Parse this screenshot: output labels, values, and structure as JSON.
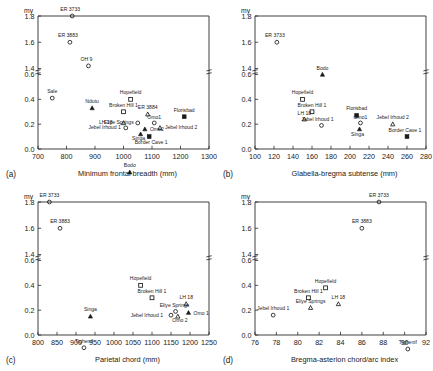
{
  "figure": {
    "y_unit_label": "my",
    "y_ticks": [
      "0.0",
      "0.2",
      "0.4",
      "0.6",
      "1.4",
      "1.6",
      "1.8"
    ],
    "y_break": true
  },
  "chart_data": [
    {
      "type": "scatter",
      "panel": "(a)",
      "title": "",
      "xlabel": "Minimum frontal breadth (mm)",
      "ylabel": "my",
      "xlim": [
        700,
        1300
      ],
      "xticks": [
        700,
        800,
        900,
        1000,
        1100,
        1200,
        1300
      ],
      "ylim": [
        0.0,
        1.8
      ],
      "yticks": [
        0.0,
        0.2,
        0.4,
        0.6,
        1.4,
        1.6,
        1.8
      ],
      "y_axis_break": [
        0.6,
        1.4
      ],
      "grid": false,
      "legend": "none",
      "points": [
        {
          "label": "ER 3733",
          "x": 820,
          "y": 1.8,
          "marker": "open-circle",
          "lx": -2,
          "ly": -5,
          "anchor": "middle"
        },
        {
          "label": "ER 3883",
          "x": 812,
          "y": 1.6,
          "marker": "open-circle",
          "lx": -2,
          "ly": -5,
          "anchor": "middle"
        },
        {
          "label": "OH 9",
          "x": 877,
          "y": 1.42,
          "marker": "open-circle",
          "lx": -2,
          "ly": -5,
          "anchor": "middle"
        },
        {
          "label": "Bodo",
          "x": 1022,
          "y": 0.61,
          "marker": "filled-triangle",
          "lx": 0,
          "ly": -5,
          "anchor": "middle"
        },
        {
          "label": "Sale",
          "x": 750,
          "y": 0.41,
          "marker": "open-circle",
          "lx": 0,
          "ly": -5,
          "anchor": "middle"
        },
        {
          "label": "Hopefield",
          "x": 1025,
          "y": 0.4,
          "marker": "open-square",
          "lx": 0,
          "ly": -5,
          "anchor": "middle"
        },
        {
          "label": "Ndutu",
          "x": 890,
          "y": 0.33,
          "marker": "filled-triangle",
          "lx": 0,
          "ly": -5,
          "anchor": "middle"
        },
        {
          "label": "Broken Hill 1",
          "x": 1000,
          "y": 0.3,
          "marker": "open-square",
          "lx": 0,
          "ly": -5,
          "anchor": "middle"
        },
        {
          "label": "ER 3884",
          "x": 1085,
          "y": 0.28,
          "marker": "open-triangle",
          "lx": 0,
          "ly": -5,
          "anchor": "middle"
        },
        {
          "label": "Florisbad",
          "x": 1213,
          "y": 0.26,
          "marker": "filled-square",
          "lx": 0,
          "ly": -5,
          "anchor": "middle"
        },
        {
          "label": "LH 18",
          "x": 1000,
          "y": 0.21,
          "marker": "open-triangle",
          "lx": -11,
          "ly": 1,
          "anchor": "end"
        },
        {
          "label": "Eliye Springs",
          "x": 1050,
          "y": 0.21,
          "marker": "open-circle",
          "lx": -4,
          "ly": 1,
          "anchor": "end"
        },
        {
          "label": "Omo1",
          "x": 1108,
          "y": 0.21,
          "marker": "open-circle",
          "lx": 0,
          "ly": -4,
          "anchor": "middle"
        },
        {
          "label": "Jebel Irhoud 1",
          "x": 1008,
          "y": 0.17,
          "marker": "open-circle",
          "lx": -5,
          "ly": 1,
          "anchor": "end"
        },
        {
          "label": "Omo2",
          "x": 1075,
          "y": 0.16,
          "marker": "filled-triangle",
          "lx": 5,
          "ly": 2,
          "anchor": "start"
        },
        {
          "label": "Jebel Irhoud 2",
          "x": 1128,
          "y": 0.17,
          "marker": "open-triangle",
          "lx": 5,
          "ly": 1,
          "anchor": "start"
        },
        {
          "label": "Singa",
          "x": 1060,
          "y": 0.12,
          "marker": "filled-triangle",
          "lx": -2,
          "ly": 6,
          "anchor": "middle"
        },
        {
          "label": "Border Cave 1",
          "x": 1090,
          "y": 0.1,
          "marker": "filled-square",
          "lx": 2,
          "ly": 7,
          "anchor": "middle"
        }
      ]
    },
    {
      "type": "scatter",
      "panel": "(b)",
      "title": "",
      "xlabel": "Glabella-bregma subtense (mm)",
      "ylabel": "my",
      "xlim": [
        100,
        280
      ],
      "xticks": [
        100,
        120,
        140,
        160,
        180,
        200,
        220,
        240,
        260,
        280
      ],
      "ylim": [
        0.0,
        1.8
      ],
      "yticks": [
        0.0,
        0.2,
        0.4,
        0.6,
        1.4,
        1.6,
        1.8
      ],
      "y_axis_break": [
        0.6,
        1.4
      ],
      "grid": false,
      "legend": "none",
      "points": [
        {
          "label": "ER 3733",
          "x": 123,
          "y": 1.6,
          "marker": "open-circle",
          "lx": -2,
          "ly": -5,
          "anchor": "middle"
        },
        {
          "label": "Bodo",
          "x": 171,
          "y": 0.6,
          "marker": "filled-triangle",
          "lx": 0,
          "ly": -5,
          "anchor": "middle"
        },
        {
          "label": "Hopefield",
          "x": 150,
          "y": 0.4,
          "marker": "open-square",
          "lx": 0,
          "ly": -5,
          "anchor": "middle"
        },
        {
          "label": "Broken Hill 1",
          "x": 160,
          "y": 0.3,
          "marker": "open-square",
          "lx": 0,
          "ly": -5,
          "anchor": "middle"
        },
        {
          "label": "Florisbad",
          "x": 207,
          "y": 0.27,
          "marker": "filled-square",
          "lx": 0,
          "ly": -5,
          "anchor": "middle"
        },
        {
          "label": "LH 18",
          "x": 152,
          "y": 0.24,
          "marker": "open-triangle",
          "lx": 0,
          "ly": -4,
          "anchor": "middle"
        },
        {
          "label": "Omo1",
          "x": 211,
          "y": 0.21,
          "marker": "open-circle",
          "lx": 0,
          "ly": -4,
          "anchor": "middle"
        },
        {
          "label": "Jebel Irhoud 1",
          "x": 170,
          "y": 0.19,
          "marker": "open-circle",
          "lx": -4,
          "ly": -4,
          "anchor": "middle"
        },
        {
          "label": "Jebel Irhoud 2",
          "x": 245,
          "y": 0.2,
          "marker": "open-triangle",
          "lx": 0,
          "ly": -5,
          "anchor": "middle"
        },
        {
          "label": "Singa",
          "x": 210,
          "y": 0.16,
          "marker": "filled-triangle",
          "lx": -2,
          "ly": 7,
          "anchor": "middle"
        },
        {
          "label": "Border Cave 1",
          "x": 260,
          "y": 0.1,
          "marker": "filled-square",
          "lx": -2,
          "ly": -5,
          "anchor": "middle"
        }
      ]
    },
    {
      "type": "scatter",
      "panel": "(c)",
      "title": "",
      "xlabel": "Parietal chord (mm)",
      "ylabel": "my",
      "xlim": [
        800,
        1250
      ],
      "xticks": [
        800,
        850,
        900,
        950,
        1000,
        1050,
        1100,
        1150,
        1200,
        1250
      ],
      "ylim": [
        0.0,
        1.8
      ],
      "yticks": [
        0.0,
        0.2,
        0.4,
        0.6,
        1.4,
        1.6,
        1.8
      ],
      "y_axis_break": [
        0.6,
        1.4
      ],
      "grid": false,
      "legend": "none",
      "points": [
        {
          "label": "ER 3733",
          "x": 830,
          "y": 1.8,
          "marker": "open-circle",
          "lx": 0,
          "ly": -5,
          "anchor": "middle"
        },
        {
          "label": "ER 3883",
          "x": 858,
          "y": 1.6,
          "marker": "open-circle",
          "lx": 0,
          "ly": -5,
          "anchor": "middle"
        },
        {
          "label": "Tighenif",
          "x": 921,
          "y": 0.69,
          "marker": "open-circle",
          "lx": 0,
          "ly": -5,
          "anchor": "middle"
        },
        {
          "label": "Hopefield",
          "x": 1070,
          "y": 0.4,
          "marker": "open-square",
          "lx": 0,
          "ly": -5,
          "anchor": "middle"
        },
        {
          "label": "Broken Hill 1",
          "x": 1100,
          "y": 0.3,
          "marker": "open-square",
          "lx": 0,
          "ly": -5,
          "anchor": "middle"
        },
        {
          "label": "LH 18",
          "x": 1190,
          "y": 0.25,
          "marker": "open-triangle",
          "lx": 0,
          "ly": -5,
          "anchor": "middle"
        },
        {
          "label": "Eliye Springs",
          "x": 1162,
          "y": 0.19,
          "marker": "open-circle",
          "lx": -1,
          "ly": -4,
          "anchor": "middle"
        },
        {
          "label": "Omo 1",
          "x": 1196,
          "y": 0.18,
          "marker": "filled-triangle",
          "lx": 5,
          "ly": 2,
          "anchor": "start"
        },
        {
          "label": "Omo 2",
          "x": 1168,
          "y": 0.15,
          "marker": "open-triangle",
          "lx": 2,
          "ly": 6,
          "anchor": "middle"
        },
        {
          "label": "Jebel Irhoud 1",
          "x": 1150,
          "y": 0.16,
          "marker": "open-circle",
          "lx": -8,
          "ly": 2,
          "anchor": "end"
        },
        {
          "label": "Singa",
          "x": 938,
          "y": 0.15,
          "marker": "filled-triangle",
          "lx": 0,
          "ly": -5,
          "anchor": "middle"
        }
      ]
    },
    {
      "type": "scatter",
      "panel": "(d)",
      "title": "",
      "xlabel": "Bregma-asterion chord/arc index",
      "ylabel": "my",
      "xlim": [
        76,
        92
      ],
      "xticks": [
        76,
        78,
        80,
        82,
        84,
        86,
        88,
        90,
        92
      ],
      "ylim": [
        0.0,
        1.8
      ],
      "yticks": [
        0.0,
        0.2,
        0.4,
        0.6,
        1.4,
        1.6,
        1.8
      ],
      "y_axis_break": [
        0.6,
        1.4
      ],
      "grid": false,
      "legend": "none",
      "points": [
        {
          "label": "ER 3733",
          "x": 87.6,
          "y": 1.8,
          "marker": "open-circle",
          "lx": 0,
          "ly": -5,
          "anchor": "middle"
        },
        {
          "label": "ER 3883",
          "x": 86.0,
          "y": 1.6,
          "marker": "open-circle",
          "lx": 0,
          "ly": -5,
          "anchor": "middle"
        },
        {
          "label": "Tighenif",
          "x": 90.3,
          "y": 0.68,
          "marker": "open-circle",
          "lx": 0,
          "ly": -5,
          "anchor": "middle"
        },
        {
          "label": "Hopefield",
          "x": 82.6,
          "y": 0.38,
          "marker": "open-square",
          "lx": 0,
          "ly": -5,
          "anchor": "middle"
        },
        {
          "label": "Broken Hill 1",
          "x": 81.0,
          "y": 0.3,
          "marker": "open-square",
          "lx": 0,
          "ly": -5,
          "anchor": "middle"
        },
        {
          "label": "LH 18",
          "x": 83.8,
          "y": 0.25,
          "marker": "open-triangle",
          "lx": 0,
          "ly": -5,
          "anchor": "middle"
        },
        {
          "label": "Eliye Springs",
          "x": 81.2,
          "y": 0.22,
          "marker": "open-triangle",
          "lx": 0,
          "ly": -5,
          "anchor": "middle"
        },
        {
          "label": "Jebel Irhoud 1",
          "x": 77.7,
          "y": 0.16,
          "marker": "open-circle",
          "lx": 0,
          "ly": -5,
          "anchor": "middle"
        }
      ]
    }
  ]
}
